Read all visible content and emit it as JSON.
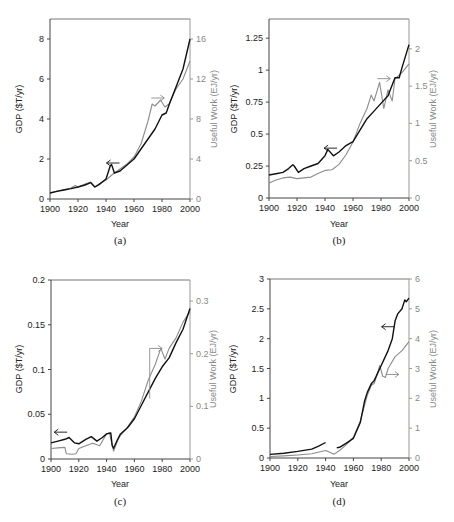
{
  "chart_data": [
    {
      "type": "line",
      "panel": "a",
      "caption": "(a)",
      "xlabel": "Year",
      "ylabel": "GDP ($T/yr)",
      "ylabel_right": "Useful Work (EJ/yr)",
      "xlim": [
        1900,
        2000
      ],
      "ylim": [
        0,
        9
      ],
      "ylim_right": [
        0,
        18
      ],
      "xticks": [
        1900,
        1920,
        1940,
        1960,
        1980,
        2000
      ],
      "yticks": [
        0,
        2,
        4,
        6,
        8
      ],
      "yticks_right": [
        0,
        4,
        8,
        12,
        16
      ],
      "grid": false,
      "colors": {
        "gdp": "#111111",
        "work": "#8c8c8c"
      },
      "annotations": [
        {
          "type": "arrow-left",
          "series": "GDP",
          "x": 1945,
          "y": 1.8
        },
        {
          "type": "arrow-right",
          "series": "Useful Work",
          "x": 1977,
          "y": 10.1
        }
      ],
      "series": [
        {
          "name": "GDP",
          "axis": "left",
          "x": [
            1900,
            1905,
            1910,
            1915,
            1920,
            1925,
            1929,
            1932,
            1935,
            1940,
            1943,
            1944,
            1946,
            1950,
            1955,
            1960,
            1965,
            1970,
            1975,
            1980,
            1983,
            1985,
            1990,
            1995,
            2000
          ],
          "values": [
            0.3,
            0.38,
            0.45,
            0.52,
            0.6,
            0.7,
            0.82,
            0.6,
            0.72,
            1.0,
            1.65,
            1.72,
            1.3,
            1.4,
            1.7,
            2.0,
            2.5,
            3.0,
            3.5,
            4.2,
            4.3,
            4.7,
            5.6,
            6.5,
            8.0
          ]
        },
        {
          "name": "Useful Work",
          "axis": "right",
          "x": [
            1900,
            1905,
            1910,
            1915,
            1918,
            1920,
            1925,
            1929,
            1932,
            1935,
            1940,
            1945,
            1950,
            1955,
            1960,
            1965,
            1970,
            1973,
            1975,
            1979,
            1982,
            1985,
            1990,
            1995,
            2000
          ],
          "values": [
            0.6,
            0.8,
            0.95,
            1.1,
            1.35,
            1.2,
            1.5,
            1.7,
            1.2,
            1.5,
            1.9,
            2.5,
            3.0,
            3.5,
            4.2,
            5.5,
            7.8,
            9.5,
            9.3,
            9.9,
            9.2,
            9.5,
            11.0,
            12.0,
            13.8
          ]
        }
      ]
    },
    {
      "type": "line",
      "panel": "b",
      "caption": "(b)",
      "xlabel": "Year",
      "ylabel": "GDP ($T/yr)",
      "ylabel_right": "Useful Work (EJ/yr)",
      "xlim": [
        1900,
        2000
      ],
      "ylim": [
        0,
        1.4
      ],
      "ylim_right": [
        0,
        2.4
      ],
      "xticks": [
        1900,
        1920,
        1940,
        1960,
        1980,
        2000
      ],
      "yticks": [
        0,
        0.25,
        0.5,
        0.75,
        1,
        1.25
      ],
      "ytick_labels": [
        "0",
        "0.25",
        "0.5",
        "0.75",
        "1",
        "1.25"
      ],
      "yticks_right": [
        0,
        0.5,
        1,
        1.5,
        2
      ],
      "ytick_labels_right": [
        "0",
        "0.5",
        "1",
        "1.5",
        "2"
      ],
      "grid": false,
      "colors": {
        "gdp": "#111111",
        "work": "#8c8c8c"
      },
      "annotations": [
        {
          "type": "arrow-left",
          "series": "GDP",
          "x": 1944,
          "y": 0.39
        },
        {
          "type": "arrow-right",
          "series": "Useful Work",
          "x": 1982,
          "y": 1.6
        }
      ],
      "series": [
        {
          "name": "GDP",
          "axis": "left",
          "x": [
            1900,
            1905,
            1910,
            1914,
            1917,
            1918,
            1921,
            1925,
            1930,
            1935,
            1940,
            1942,
            1946,
            1950,
            1955,
            1960,
            1965,
            1970,
            1975,
            1980,
            1985,
            1990,
            1993,
            1995,
            2000
          ],
          "values": [
            0.18,
            0.19,
            0.2,
            0.23,
            0.26,
            0.25,
            0.2,
            0.23,
            0.25,
            0.27,
            0.33,
            0.38,
            0.33,
            0.36,
            0.41,
            0.44,
            0.53,
            0.62,
            0.68,
            0.74,
            0.8,
            0.94,
            0.94,
            1.02,
            1.2
          ]
        },
        {
          "name": "Useful Work",
          "axis": "right",
          "x": [
            1900,
            1905,
            1910,
            1915,
            1920,
            1925,
            1930,
            1935,
            1940,
            1945,
            1950,
            1955,
            1960,
            1965,
            1970,
            1973,
            1975,
            1979,
            1982,
            1985,
            1988,
            1990,
            1995,
            2000
          ],
          "values": [
            0.2,
            0.24,
            0.27,
            0.28,
            0.26,
            0.27,
            0.28,
            0.33,
            0.37,
            0.38,
            0.45,
            0.58,
            0.75,
            1.0,
            1.2,
            1.38,
            1.3,
            1.55,
            1.2,
            1.45,
            1.3,
            1.6,
            1.68,
            1.8
          ]
        }
      ]
    },
    {
      "type": "line",
      "panel": "c",
      "caption": "(c)",
      "xlabel": "Year",
      "ylabel": "GDP ($T/yr)",
      "ylabel_right": "Useful Work (EJ/yr)",
      "xlim": [
        1900,
        2000
      ],
      "ylim": [
        0,
        0.2
      ],
      "ylim_right": [
        0,
        0.34
      ],
      "xticks": [
        1900,
        1920,
        1940,
        1960,
        1980,
        2000
      ],
      "yticks": [
        0,
        0.05,
        0.1,
        0.15,
        0.2
      ],
      "ytick_labels": [
        "0",
        "0.05",
        "0.1",
        "0.15",
        "0.2"
      ],
      "yticks_right": [
        0,
        0.1,
        0.2,
        0.3
      ],
      "ytick_labels_right": [
        "0",
        "0.1",
        "0.2",
        "0.3"
      ],
      "grid": false,
      "colors": {
        "gdp": "#111111",
        "work": "#8c8c8c"
      },
      "annotations": [
        {
          "type": "arrow-left",
          "series": "GDP",
          "x": 1907,
          "y": 0.03
        },
        {
          "type": "bracket-arrow-right",
          "series": "Useful Work",
          "x": 1975,
          "y": 0.21
        }
      ],
      "series": [
        {
          "name": "GDP",
          "axis": "left",
          "x": [
            1900,
            1905,
            1910,
            1913,
            1917,
            1920,
            1925,
            1929,
            1933,
            1937,
            1940,
            1943,
            1944,
            1945,
            1948,
            1950,
            1955,
            1960,
            1965,
            1970,
            1975,
            1980,
            1985,
            1990,
            1995,
            2000
          ],
          "values": [
            0.018,
            0.02,
            0.022,
            0.024,
            0.018,
            0.017,
            0.022,
            0.025,
            0.02,
            0.024,
            0.028,
            0.029,
            0.015,
            0.012,
            0.022,
            0.028,
            0.035,
            0.045,
            0.06,
            0.075,
            0.09,
            0.103,
            0.113,
            0.13,
            0.145,
            0.168
          ]
        },
        {
          "name": "Useful Work",
          "axis": "right",
          "x": [
            1900,
            1905,
            1910,
            1911,
            1915,
            1918,
            1920,
            1925,
            1930,
            1935,
            1940,
            1942,
            1945,
            1948,
            1950,
            1955,
            1960,
            1965,
            1970,
            1975,
            1979,
            1982,
            1985,
            1990,
            1995,
            2000
          ],
          "values": [
            0.02,
            0.021,
            0.022,
            0.01,
            0.009,
            0.01,
            0.02,
            0.025,
            0.03,
            0.025,
            0.048,
            0.05,
            0.015,
            0.035,
            0.045,
            0.06,
            0.08,
            0.11,
            0.15,
            0.18,
            0.21,
            0.19,
            0.21,
            0.23,
            0.26,
            0.28
          ]
        }
      ]
    },
    {
      "type": "line",
      "panel": "d",
      "caption": "(d)",
      "xlabel": "Year",
      "ylabel": "GDP ($T/yr)",
      "ylabel_right": "Useful Work (EJ/yr)",
      "xlim": [
        1900,
        2000
      ],
      "ylim": [
        0,
        3
      ],
      "ylim_right": [
        0,
        6
      ],
      "xticks": [
        1900,
        1920,
        1940,
        1960,
        1980,
        2000
      ],
      "yticks": [
        0,
        0.5,
        1,
        1.5,
        2,
        2.5,
        3
      ],
      "ytick_labels": [
        "0",
        "0.5",
        "1",
        "1.5",
        "2",
        "2.5",
        "3"
      ],
      "yticks_right": [
        0,
        1,
        2,
        3,
        4,
        5,
        6
      ],
      "ytick_labels_right": [
        "0",
        "1",
        "2",
        "3",
        "4",
        "5",
        "6"
      ],
      "grid": false,
      "colors": {
        "gdp": "#111111",
        "work": "#8c8c8c"
      },
      "annotations": [
        {
          "type": "arrow-left",
          "series": "GDP",
          "x": 1985,
          "y": 2.2
        },
        {
          "type": "arrow-right",
          "series": "Useful Work",
          "x": 1988,
          "y": 2.8
        }
      ],
      "series": [
        {
          "name": "GDP",
          "axis": "left",
          "segments": [
            {
              "x": [
                1900,
                1910,
                1920,
                1930,
                1935,
                1940
              ],
              "values": [
                0.06,
                0.08,
                0.11,
                0.15,
                0.2,
                0.26
              ]
            },
            {
              "x": [
                1948,
                1950,
                1955,
                1960,
                1965,
                1968,
                1970,
                1973,
                1975,
                1980,
                1985,
                1988,
                1990,
                1992,
                1995,
                1997,
                1998,
                2000
              ],
              "values": [
                0.17,
                0.18,
                0.25,
                0.33,
                0.6,
                0.95,
                1.1,
                1.25,
                1.3,
                1.55,
                1.8,
                2.0,
                2.3,
                2.42,
                2.5,
                2.65,
                2.62,
                2.68
              ]
            }
          ]
        },
        {
          "name": "Useful Work",
          "axis": "right",
          "x": [
            1900,
            1910,
            1920,
            1930,
            1940,
            1945,
            1946,
            1950,
            1955,
            1960,
            1965,
            1970,
            1973,
            1975,
            1979,
            1981,
            1983,
            1985,
            1990,
            1995,
            2000
          ],
          "values": [
            0.05,
            0.07,
            0.1,
            0.14,
            0.25,
            0.15,
            0.12,
            0.25,
            0.45,
            0.7,
            1.25,
            2.1,
            2.45,
            2.5,
            3.1,
            2.75,
            2.7,
            3.0,
            3.4,
            3.6,
            3.9
          ]
        }
      ]
    }
  ]
}
